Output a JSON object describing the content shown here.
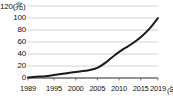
{
  "chart_data": {
    "type": "line",
    "title": "",
    "xlabel": "年",
    "ylabel": "兆",
    "y_unit_label": "120(兆)",
    "x_unit_label": "(年)",
    "grid": true,
    "legend": "none",
    "ylim": [
      0,
      120
    ],
    "xlim": [
      1989,
      2019
    ],
    "yticks": [
      "0",
      "20",
      "40",
      "60",
      "80",
      "100",
      "120"
    ],
    "ytick_values": [
      0,
      20,
      40,
      60,
      80,
      100,
      120
    ],
    "xticks": [
      "1989",
      "1995",
      "2000",
      "2005",
      "2010",
      "2015",
      "2019"
    ],
    "xtick_values": [
      1989,
      1995,
      2000,
      2005,
      2010,
      2015,
      2019
    ],
    "line_color": "#1a1a1a",
    "grid_color": "#c8c8c8",
    "background_color": "#ffffff",
    "x": [
      1989,
      1991,
      1993,
      1995,
      1997,
      1999,
      2001,
      2003,
      2005,
      2007,
      2009,
      2011,
      2013,
      2015,
      2017,
      2019
    ],
    "values": [
      1,
      2,
      3,
      5,
      7,
      9,
      11,
      13,
      17,
      26,
      38,
      48,
      57,
      68,
      82,
      100
    ],
    "series": [
      {
        "name": "推移",
        "values": [
          1,
          2,
          3,
          5,
          7,
          9,
          11,
          13,
          17,
          26,
          38,
          48,
          57,
          68,
          82,
          100
        ]
      }
    ]
  }
}
